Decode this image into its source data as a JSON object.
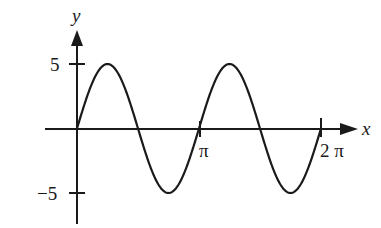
{
  "chart_data": {
    "type": "line",
    "title": "",
    "function": "y = 5 sin(2x)",
    "xlabel": "x",
    "ylabel": "y",
    "x_ticks": [
      {
        "value": 3.14159,
        "label": "π"
      },
      {
        "value": 6.28318,
        "label": "2 π"
      }
    ],
    "y_ticks": [
      {
        "value": 5,
        "label": "5"
      },
      {
        "value": -5,
        "label": "−5"
      }
    ],
    "xlim": [
      0,
      6.28318
    ],
    "ylim": [
      -5,
      5
    ],
    "grid": false,
    "legend": null,
    "series": [
      {
        "name": "5 sin 2x",
        "x": [
          0,
          0.785,
          1.571,
          2.356,
          3.142,
          3.927,
          4.712,
          5.498,
          6.283
        ],
        "values": [
          0,
          5,
          0,
          -5,
          0,
          5,
          0,
          -5,
          0
        ]
      }
    ],
    "color": "#1a1a1a"
  }
}
